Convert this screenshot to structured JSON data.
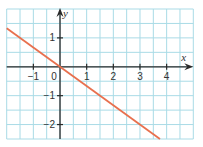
{
  "chart_data": {
    "type": "line",
    "title": "",
    "xlabel": "x",
    "ylabel": "y",
    "xlim": [
      -2,
      5
    ],
    "ylim": [
      -2.5,
      2
    ],
    "grid": true,
    "grid_step": 0.5,
    "x_ticks": [
      -1,
      0,
      1,
      2,
      3,
      4
    ],
    "x_tick_labels": [
      "−1",
      "0",
      "1",
      "2",
      "3",
      "4"
    ],
    "y_ticks": [
      1,
      -1,
      -2
    ],
    "y_tick_labels": [
      "1",
      "−1",
      "−2"
    ],
    "series": [
      {
        "name": "y = -2/3 x",
        "equation": "y = -(2/3)x",
        "slope": -0.6667,
        "intercept": 0,
        "x": [
          -2,
          3.75
        ],
        "y": [
          1.333,
          -2.5
        ],
        "color": "#e8704e"
      }
    ]
  },
  "colors": {
    "grid": "#a9dbe6",
    "axis": "#2a2a2a",
    "line": "#e8704e",
    "background": "#ffffff"
  }
}
